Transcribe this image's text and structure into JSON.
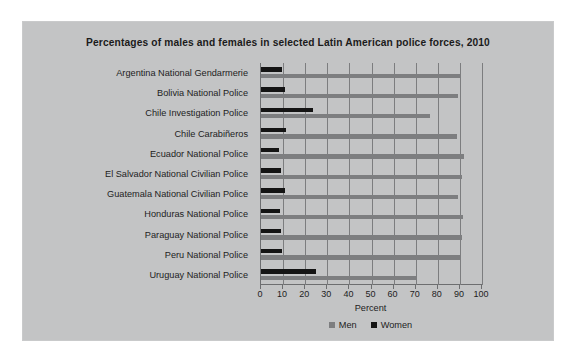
{
  "panel": {
    "background_color": "#c3c4c5"
  },
  "chart_data": {
    "type": "bar",
    "orientation": "horizontal",
    "title": "Percentages of males and females in selected Latin American police forces, 2010",
    "xlabel": "Percent",
    "ylabel": "",
    "xlim": [
      0,
      100
    ],
    "xticks": [
      0,
      10,
      20,
      30,
      40,
      50,
      60,
      70,
      80,
      90,
      100
    ],
    "grid": true,
    "legend_position": "bottom",
    "categories": [
      "Argentina National Gendarmerie",
      "Bolivia National Police",
      "Chile Investigation Police",
      "Chile Carabiñeros",
      "Ecuador National Police",
      "El Salvador National Civilian Police",
      "Guatemala National Civilian Police",
      "Honduras National Police",
      "Paraguay National Police",
      "Peru National Police",
      "Uruguay National Police"
    ],
    "series": [
      {
        "name": "Men",
        "color": "#7d7e80",
        "values": [
          90.5,
          89,
          76.5,
          88.5,
          92,
          91,
          89,
          91.5,
          91,
          90.5,
          70
        ]
      },
      {
        "name": "Women",
        "color": "#141414",
        "values": [
          9.5,
          11,
          23.5,
          11.5,
          8,
          9,
          11,
          8.5,
          9,
          9.5,
          25
        ]
      }
    ]
  },
  "legend": {
    "entries": [
      {
        "label": "Men",
        "color": "#7d7e80"
      },
      {
        "label": "Women",
        "color": "#141414"
      }
    ]
  }
}
